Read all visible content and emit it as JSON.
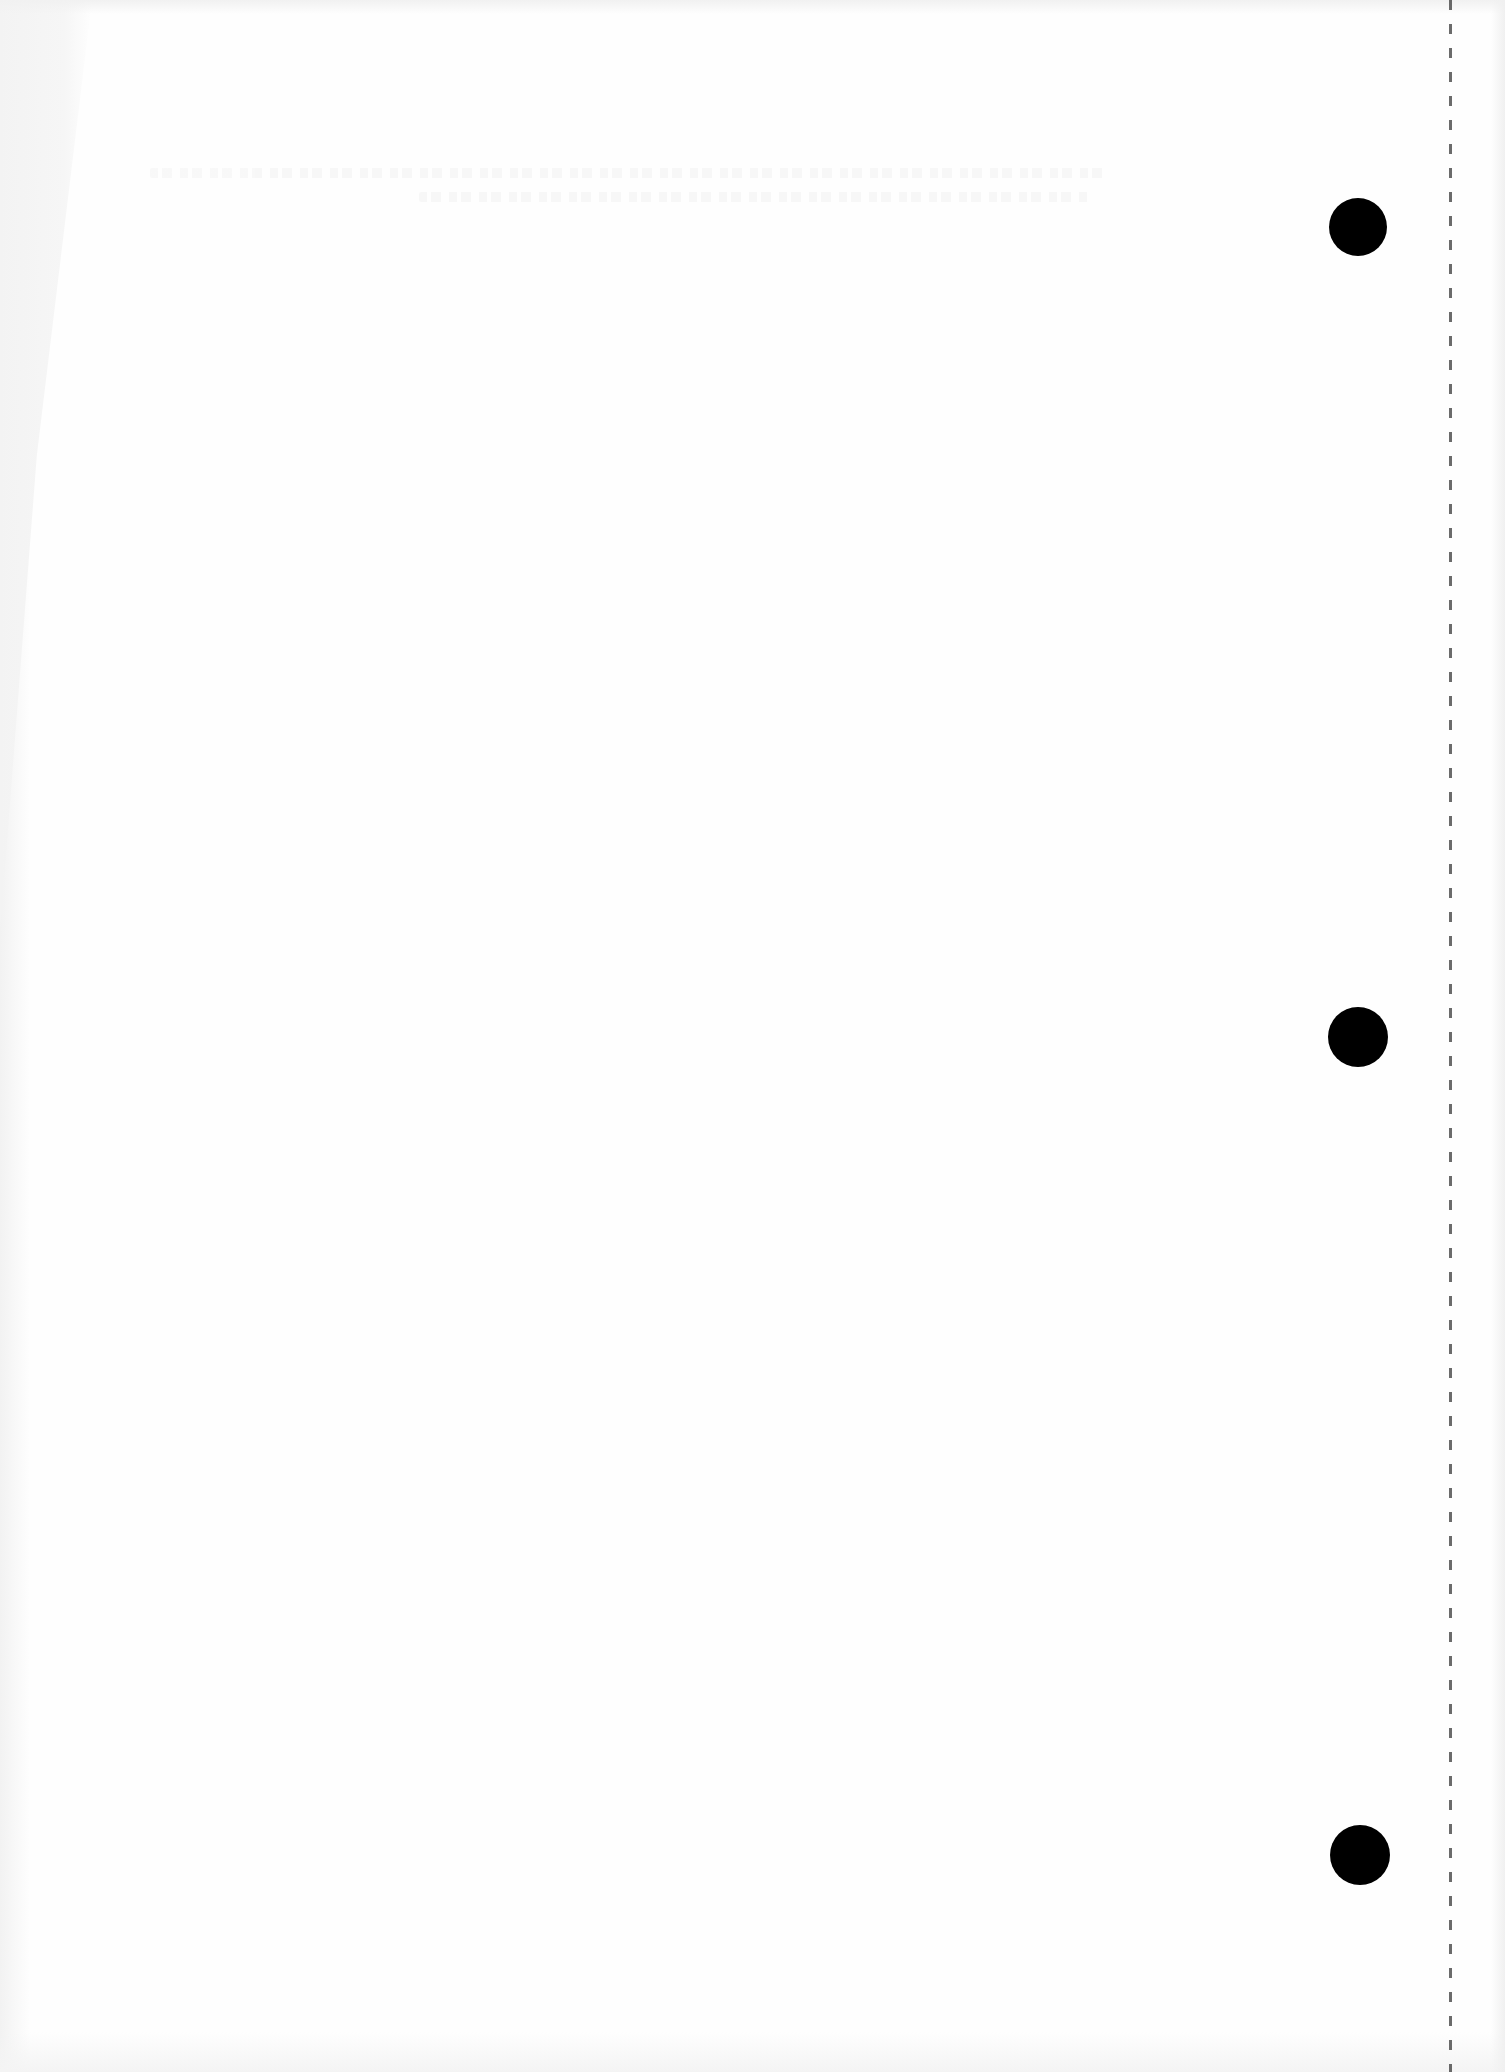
{
  "document": {
    "type": "scanned-blank-page",
    "background_color": "#fefefe",
    "content_text": "",
    "bleed_through": {
      "visible": true,
      "legible": false,
      "lines": 2
    },
    "punch_holes": [
      {
        "name": "top",
        "cx": 1358,
        "cy": 227,
        "r": 29
      },
      {
        "name": "middle",
        "cx": 1358,
        "cy": 1037,
        "r": 30
      },
      {
        "name": "bottom",
        "cx": 1360,
        "cy": 1855,
        "r": 30
      }
    ],
    "punch_hole_color": "#000000",
    "perforation_line": {
      "style": "dashed",
      "x": 1450,
      "color": "#3a3a3a"
    }
  }
}
